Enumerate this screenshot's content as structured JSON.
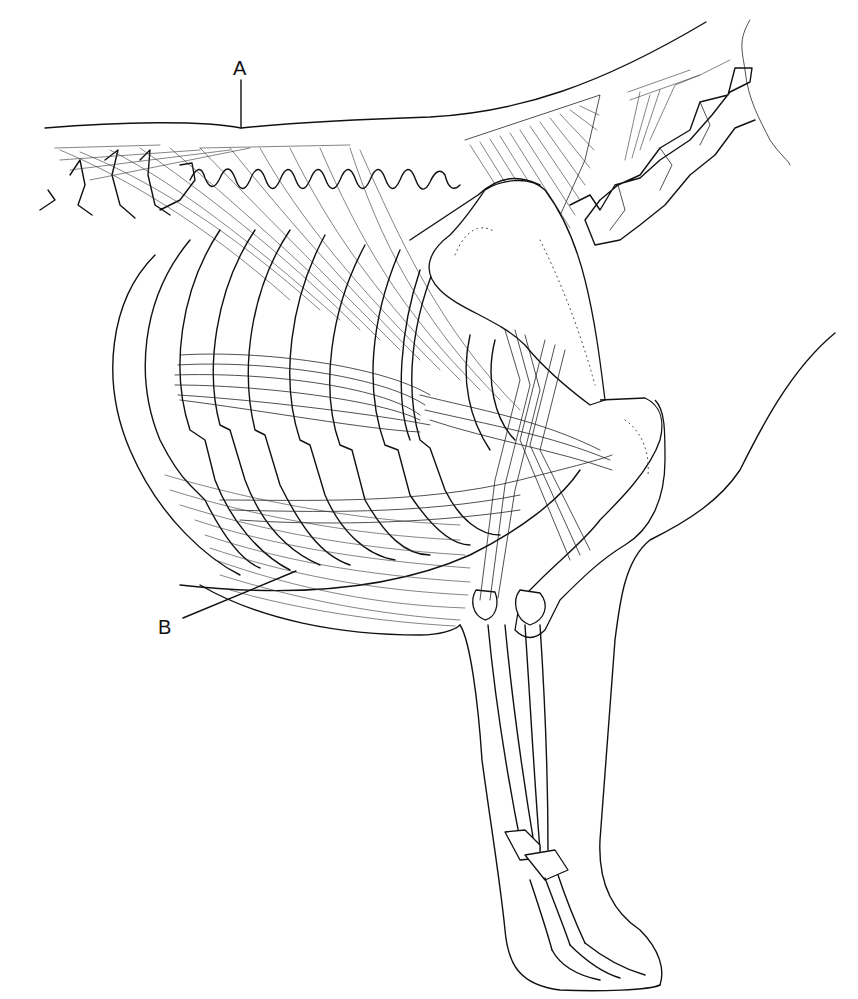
{
  "figure": {
    "type": "anatomical line drawing",
    "background": "#ffffff",
    "ink_color": "#111111"
  },
  "labels": [
    {
      "id": "A",
      "text": "A",
      "x": 233,
      "y": 58,
      "leader": {
        "x1": 241,
        "y1": 80,
        "x2": 241,
        "y2": 128
      }
    },
    {
      "id": "B",
      "text": "B",
      "x": 158,
      "y": 617,
      "leader": {
        "x1": 183,
        "y1": 618,
        "x2": 296,
        "y2": 571
      }
    }
  ]
}
